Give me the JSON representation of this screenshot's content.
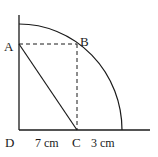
{
  "diagram": {
    "type": "geometry",
    "points": {
      "A": {
        "label": "A"
      },
      "B": {
        "label": "B"
      },
      "C": {
        "label": "C"
      },
      "D": {
        "label": "D"
      }
    },
    "segments": [
      {
        "from": "A",
        "to": "C",
        "style": "solid"
      },
      {
        "from": "A",
        "to": "B",
        "style": "dashed"
      },
      {
        "from": "B",
        "to": "C",
        "style": "dashed"
      }
    ],
    "measurements": {
      "DC": "7 cm",
      "C_to_arc": "3 cm"
    },
    "colors": {
      "line": "#1a1a1a",
      "background": "#ffffff"
    }
  }
}
